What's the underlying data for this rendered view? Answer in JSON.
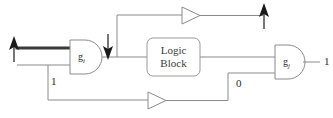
{
  "diagram": {
    "canvas": {
      "width": 333,
      "height": 118,
      "background": "#ffffff"
    },
    "colors": {
      "wire": "#8a8a8a",
      "wire_bold": "#3a3a3a",
      "gate_outline": "#8a8a8a",
      "block_outline": "#9a9a9a",
      "text": "#2b2b2b",
      "arrow": "#1a1a1a"
    },
    "gates": [
      {
        "id": "gi",
        "label_main": "g",
        "label_sub": "i",
        "type": "and-gate"
      },
      {
        "id": "gj",
        "label_main": "g",
        "label_sub": "j",
        "type": "and-gate"
      }
    ],
    "block": {
      "id": "logic-block",
      "line1": "Logic",
      "line2": "Block"
    },
    "buffers": [
      {
        "id": "buffer-top",
        "type": "buffer-triangle"
      },
      {
        "id": "buffer-bottom",
        "type": "buffer-triangle"
      }
    ],
    "arrows": [
      {
        "id": "input-rising",
        "glyph": "up-arrow",
        "direction": "up"
      },
      {
        "id": "gi-output-falling",
        "glyph": "down-arrow",
        "direction": "down"
      },
      {
        "id": "top-output-rising",
        "glyph": "up-arrow",
        "direction": "up"
      }
    ],
    "signal_labels": [
      {
        "id": "label-one-left",
        "value": "1"
      },
      {
        "id": "label-zero-right",
        "value": "0"
      },
      {
        "id": "label-one-output",
        "value": "1"
      }
    ]
  }
}
